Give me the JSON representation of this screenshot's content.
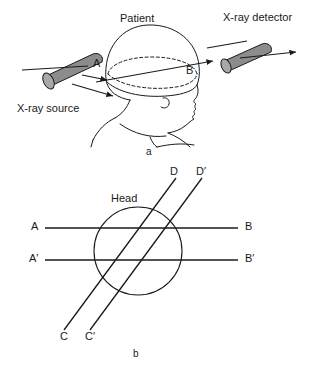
{
  "figure": {
    "title_text": "",
    "stroke_color": "#1a1a1a",
    "cylinder_fill": "#8c8c8c",
    "cylinder_cap_fill": "#a8a8a8",
    "background": "#ffffff"
  },
  "panel_a": {
    "caption": "a",
    "labels": {
      "source": "X-ray source",
      "patient": "Patient",
      "detector": "X-ray detector",
      "entry_point": "A",
      "exit_point": "B"
    },
    "icons": {
      "source_cylinder": "x-ray-source-cylinder-icon",
      "detector_cylinder": "x-ray-detector-cylinder-icon",
      "head_profile": "head-profile-icon",
      "beam_arrow": "beam-arrow-icon"
    }
  },
  "panel_b": {
    "caption": "b",
    "labels": {
      "head": "Head",
      "a": "A",
      "a_prime": "A′",
      "b": "B",
      "b_prime": "B′",
      "c": "C",
      "c_prime": "C′",
      "d": "D",
      "d_prime": "D′"
    },
    "geometry": {
      "circle_center_x": 138,
      "circle_center_y": 91,
      "circle_radius": 44,
      "ray_ab_y": 68,
      "ray_ab_x1": 45,
      "ray_ab_x2": 238,
      "ray_apbp_y": 100,
      "ray_apbp_x1": 45,
      "ray_apbp_x2": 238,
      "ray_cd_x1": 64,
      "ray_cd_y1": 170,
      "ray_cd_x2": 176,
      "ray_cd_y2": 18,
      "ray_cpdp_x1": 90,
      "ray_cpdp_y1": 170,
      "ray_cpdp_x2": 202,
      "ray_cpdp_y2": 18
    }
  }
}
